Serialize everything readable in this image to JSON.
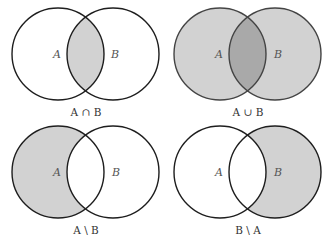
{
  "colors": {
    "fill": "#d2d2d2",
    "overlap_fill": "#a9a9a9",
    "stroke": "#1e1e1e",
    "stroke_union": "#444444",
    "background": "#ffffff"
  },
  "panels": [
    {
      "id": "intersection",
      "set_a": "A",
      "set_b": "B",
      "caption": "A ∩ B",
      "shaded": "intersection"
    },
    {
      "id": "union",
      "set_a": "A",
      "set_b": "B",
      "caption": "A ∪ B",
      "shaded": "union"
    },
    {
      "id": "difference-a-b",
      "set_a": "A",
      "set_b": "B",
      "caption": "A \\ B",
      "shaded": "A minus B"
    },
    {
      "id": "difference-b-a",
      "set_a": "A",
      "set_b": "B",
      "caption": "B \\ A",
      "shaded": "B minus A"
    }
  ]
}
